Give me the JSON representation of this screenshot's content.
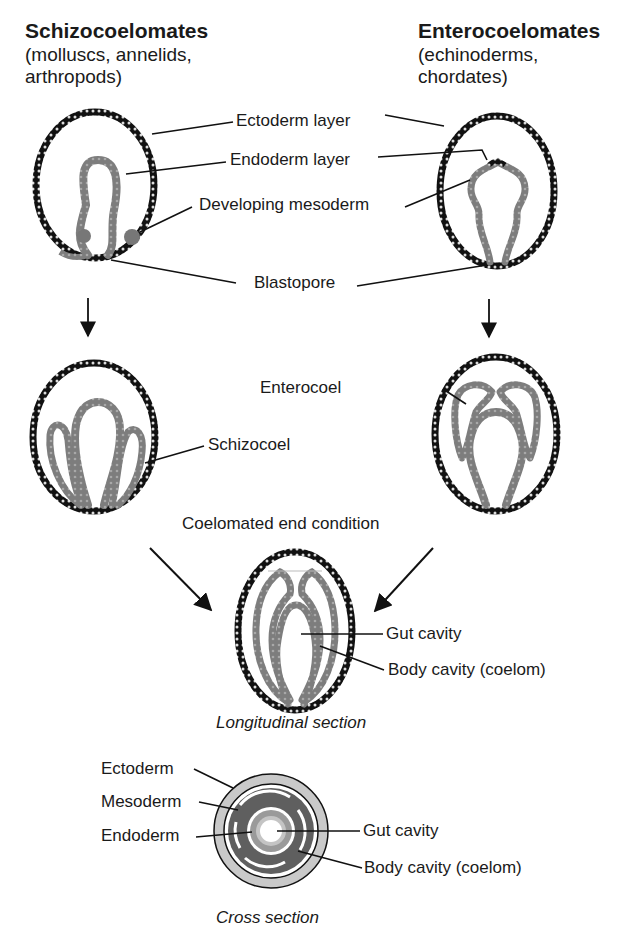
{
  "columns": {
    "left": {
      "title": "Schizocoelomates",
      "examples_line1": "(molluscs, annelids,",
      "examples_line2": "arthropods)"
    },
    "right": {
      "title": "Enterocoelomates",
      "examples_line1": "(echinoderms,",
      "examples_line2": "chordates)"
    }
  },
  "stage1_labels": {
    "ectoderm": "Ectoderm layer",
    "endoderm": "Endoderm layer",
    "mesoderm": "Developing mesoderm",
    "blastopore": "Blastopore"
  },
  "stage2_labels": {
    "schizocoel": "Schizocoel",
    "enterocoel": "Enterocoel"
  },
  "end_condition": {
    "title": "Coelomated end condition",
    "gut_cavity": "Gut cavity",
    "body_cavity": "Body cavity (coelom)",
    "caption": "Longitudinal section"
  },
  "cross_section": {
    "ectoderm": "Ectoderm",
    "mesoderm": "Mesoderm",
    "endoderm": "Endoderm",
    "gut_cavity": "Gut cavity",
    "body_cavity": "Body cavity (coelom)",
    "caption": "Cross section"
  },
  "colors": {
    "ectoderm": "#1a1a1a",
    "mesoderm": "#7a7a7a",
    "endoderm": "#8c8c8c",
    "cross_outer": "#c8c8c8",
    "cross_meso": "#5e5e5e"
  }
}
